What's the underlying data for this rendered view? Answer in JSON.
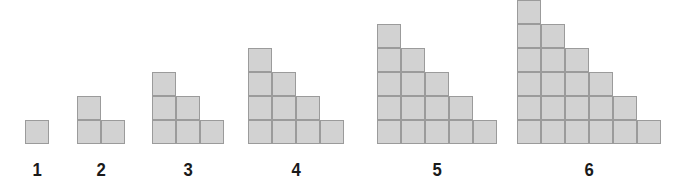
{
  "figure": {
    "background_color": "#ffffff",
    "cell_fill_color": "#d2d2d2",
    "cell_border_color": "#9b9b9b",
    "label_color": "#1a1a1a",
    "cell_size_px": 24,
    "baseline_y_px": 144
  },
  "chart_data": {
    "type": "bar",
    "subtitle": "",
    "xlabel": "",
    "ylabel": "",
    "grid": false,
    "legend": null,
    "categories": [
      "1",
      "2",
      "3",
      "4",
      "5",
      "6"
    ],
    "values": [
      1,
      3,
      6,
      10,
      15,
      21
    ],
    "value_name": "total squares",
    "series": [
      {
        "name": "column heights",
        "values": [
          [
            1
          ],
          [
            2,
            1
          ],
          [
            3,
            2,
            1
          ],
          [
            4,
            3,
            2,
            1
          ],
          [
            5,
            4,
            3,
            2,
            1
          ],
          [
            6,
            5,
            4,
            3,
            2,
            1
          ]
        ]
      }
    ],
    "xlim": [
      0,
      7
    ],
    "ylim": [
      0,
      6
    ]
  },
  "figures": [
    {
      "label": "1",
      "columns": [
        1
      ],
      "total_squares": 1,
      "left_px": 25,
      "width_px": 24,
      "height_px": 24
    },
    {
      "label": "2",
      "columns": [
        2,
        1
      ],
      "total_squares": 3,
      "left_px": 77,
      "width_px": 48,
      "height_px": 48
    },
    {
      "label": "3",
      "columns": [
        3,
        2,
        1
      ],
      "total_squares": 6,
      "left_px": 152,
      "width_px": 72,
      "height_px": 72
    },
    {
      "label": "4",
      "columns": [
        4,
        3,
        2,
        1
      ],
      "total_squares": 10,
      "left_px": 248,
      "width_px": 96,
      "height_px": 96
    },
    {
      "label": "5",
      "columns": [
        5,
        4,
        3,
        2,
        1
      ],
      "total_squares": 15,
      "left_px": 377,
      "width_px": 120,
      "height_px": 120
    },
    {
      "label": "6",
      "columns": [
        6,
        5,
        4,
        3,
        2,
        1
      ],
      "total_squares": 21,
      "left_px": 517,
      "width_px": 144,
      "height_px": 144
    }
  ]
}
